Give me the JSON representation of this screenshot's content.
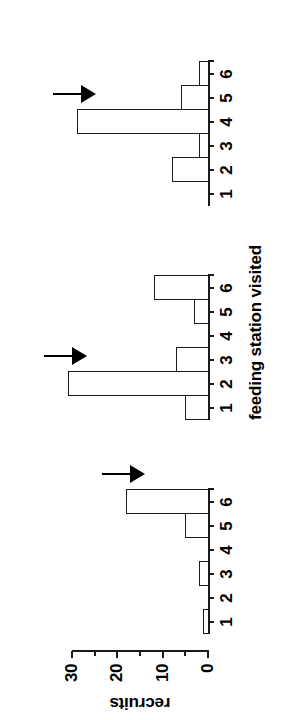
{
  "figure": {
    "axis_title_x": "feeding station visited",
    "axis_title_y": "recruits",
    "accent_color": "#000000",
    "line_color": "#1a1a1a",
    "background_color": "#ffffff"
  },
  "chart_data": {
    "type": "bar",
    "title": "",
    "xlabel": "feeding station visited",
    "ylabel": "recruits",
    "categories": [
      "1",
      "2",
      "3",
      "4",
      "5",
      "6"
    ],
    "ylim": [
      0,
      32
    ],
    "yticks": [
      0,
      5,
      10,
      15,
      20,
      25,
      30
    ],
    "ytick_labels": [
      "0",
      "",
      "10",
      "",
      "20",
      "",
      "30"
    ],
    "ytick_labels_shown": [
      "0",
      "10",
      "20",
      "30"
    ],
    "grid": false,
    "legend": false,
    "orientation": "vertical",
    "panel_layout": "1 row x 3 columns",
    "panels": [
      {
        "index": 1,
        "name": "panel-a",
        "values": [
          1,
          0,
          2,
          0,
          5,
          18
        ],
        "arrow_marks_category": "6",
        "arrow_value": 18
      },
      {
        "index": 2,
        "name": "panel-b",
        "values": [
          5,
          31,
          7,
          0,
          3,
          12
        ],
        "arrow_marks_category": "2",
        "arrow_value": 31
      },
      {
        "index": 3,
        "name": "panel-c",
        "values": [
          0,
          8,
          2,
          29,
          6,
          2
        ],
        "arrow_marks_category": "4",
        "arrow_value": 29
      }
    ]
  }
}
